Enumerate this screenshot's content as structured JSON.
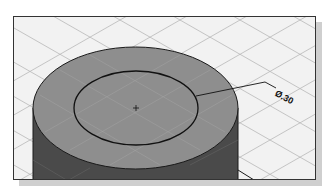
{
  "figure": {
    "dimension": {
      "label": "Ø.30"
    },
    "colors": {
      "background": "#f2f2f2",
      "grid": "#b8b8b8",
      "top_face": "#8e8e8e",
      "side_face": "#4a4a4a",
      "outline": "#1a1a1a",
      "frame_border": "#333333",
      "shadow": "#cfcfcf"
    }
  }
}
